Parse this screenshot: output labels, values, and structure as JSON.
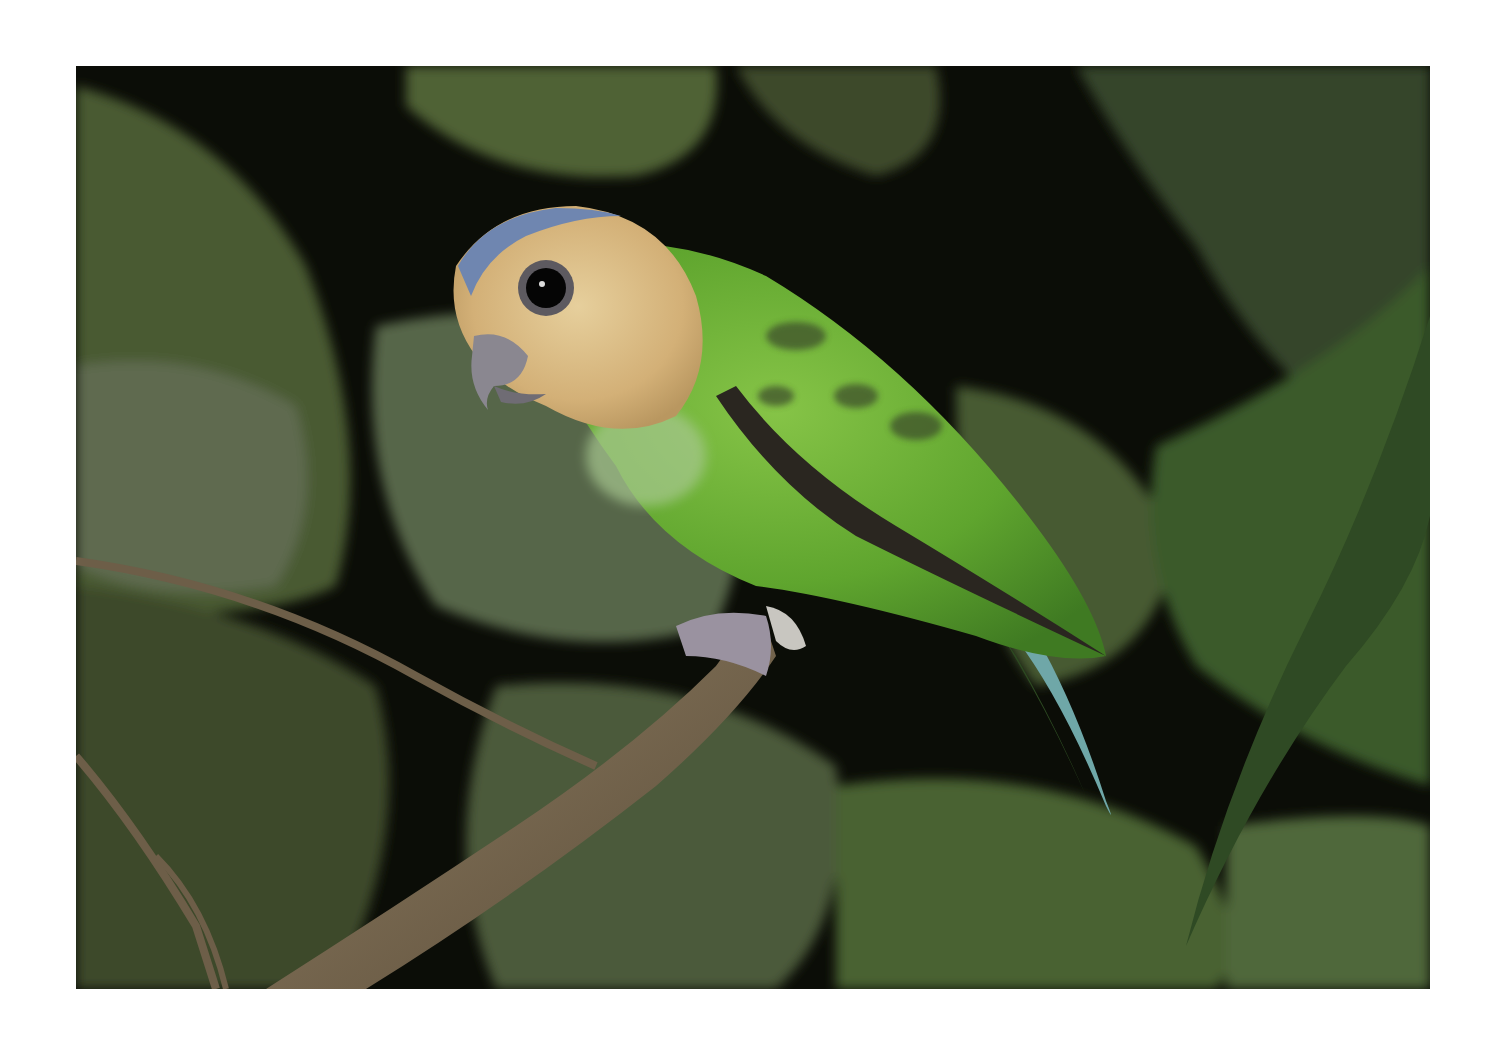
{
  "image": {
    "subject": "green parrot perched on branch",
    "description": "A small green parrot with a tan/buff face, blue crown, dark eye and grey hooked beak perched on a diagonal brown branch among dark green leaves at night.",
    "colors": {
      "background": "#ffffff",
      "frame_dark": "#0b0d07",
      "leaf_dark": "#2f3f22",
      "leaf_mid": "#4d6234",
      "leaf_light": "#6f7f55",
      "bird_green": "#5fa52e",
      "bird_green_light": "#7fbf3f",
      "face_tan": "#d8b87c",
      "crown_blue": "#6f86b0",
      "beak_grey": "#8a8790",
      "branch_brown": "#7a6a52",
      "tail_blue": "#6fa7a8"
    }
  }
}
